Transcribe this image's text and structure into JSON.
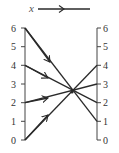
{
  "diagram": {
    "title": "",
    "direction_label": "x",
    "left_axis": {
      "ticks": [
        "0",
        "1",
        "2",
        "3",
        "4",
        "5",
        "6"
      ]
    },
    "right_axis": {
      "ticks": [
        "0",
        "1",
        "2",
        "3",
        "4",
        "5",
        "6"
      ]
    },
    "lines": [
      {
        "from_left": 6,
        "to_right": 1
      },
      {
        "from_left": 4,
        "to_right": 2
      },
      {
        "from_left": 2,
        "to_right": 3
      },
      {
        "from_left": 0,
        "to_right": 4
      }
    ],
    "colors": {
      "line": "#2a2a2a",
      "axis": "#444444",
      "text": "#333333"
    }
  }
}
